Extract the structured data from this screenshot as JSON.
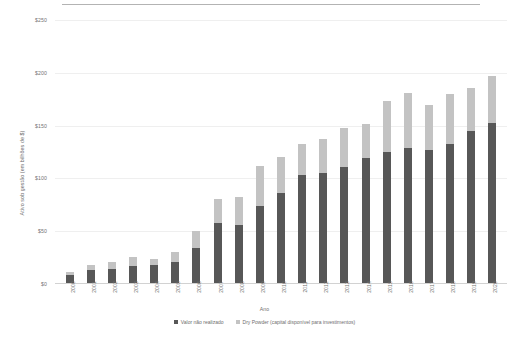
{
  "page": {
    "top_rule": true
  },
  "chart_data": {
    "type": "bar",
    "stacked": true,
    "title": "",
    "xlabel": "Ano",
    "ylabel": "Ativo sob gestão (em bilhões de $)",
    "ylim": [
      0,
      250
    ],
    "yticks": [
      0,
      50,
      100,
      150,
      200,
      250
    ],
    "ytick_labels": [
      "$0",
      "$50",
      "$100",
      "$150",
      "$200",
      "$250"
    ],
    "grid": true,
    "legend_position": "bottom",
    "categories": [
      "2000",
      "2001",
      "2002",
      "2003",
      "2004",
      "2005",
      "2006",
      "2007",
      "2008",
      "2009",
      "2010",
      "2011",
      "2012",
      "2013",
      "2014",
      "2015",
      "2016",
      "2017",
      "2018",
      "2019",
      "2020"
    ],
    "series": [
      {
        "name": "Valor não realizado",
        "color": "#575757",
        "values": [
          8,
          12,
          13,
          16,
          17,
          20,
          33,
          57,
          55,
          73,
          85,
          102,
          104,
          110,
          118,
          124,
          128,
          126,
          132,
          144,
          152
        ]
      },
      {
        "name": "Dry Powder (capital disponível para investimentos)",
        "color": "#c3c3c3",
        "values": [
          2,
          5,
          7,
          9,
          6,
          9,
          16,
          23,
          26,
          38,
          34,
          30,
          32,
          37,
          33,
          48,
          52,
          43,
          47,
          41,
          44
        ]
      }
    ],
    "totals": [
      10,
      17,
      20,
      25,
      23,
      29,
      49,
      80,
      81,
      111,
      119,
      132,
      136,
      147,
      151,
      172,
      180,
      169,
      179,
      185,
      196
    ]
  },
  "legend": {
    "items": [
      {
        "label": "Valor não realizado",
        "color": "#575757"
      },
      {
        "label": "Dry Powder (capital disponível para investimentos)",
        "color": "#c3c3c3"
      }
    ]
  },
  "axes": {
    "x_title": "Ano",
    "y_title": "Ativo sob gestão (em bilhões de $)"
  }
}
